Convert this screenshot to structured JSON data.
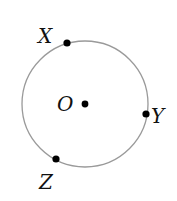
{
  "diagram": {
    "type": "circle-with-points",
    "circle": {
      "cx": 85,
      "cy": 104,
      "r": 63,
      "stroke": "#9a9a9a"
    },
    "points": [
      {
        "id": "X",
        "label": "X",
        "x": 67,
        "y": 43,
        "lx": 38,
        "ly": 43
      },
      {
        "id": "Y",
        "label": "Y",
        "x": 146,
        "y": 114,
        "lx": 151,
        "ly": 123
      },
      {
        "id": "Z",
        "label": "Z",
        "x": 56,
        "y": 159,
        "lx": 39,
        "ly": 189
      },
      {
        "id": "O",
        "label": "O",
        "x": 85,
        "y": 104,
        "lx": 57,
        "ly": 111
      }
    ]
  }
}
